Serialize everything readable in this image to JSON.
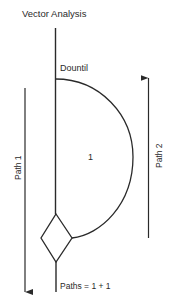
{
  "title": "Vector Analysis",
  "loop_label": "Dountil",
  "region_label": "1",
  "path1_label": "Path 1",
  "path2_label": "Path 2",
  "result_label": "Paths = 1 + 1",
  "colors": {
    "line": "#2a2a2a",
    "background": "#ffffff"
  }
}
